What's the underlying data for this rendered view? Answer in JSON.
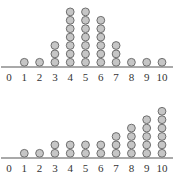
{
  "colors": {
    "dot_fill": "#c6c6c6",
    "dot_stroke": "#6e6e6e",
    "axis": "#555555",
    "label": "#333333"
  },
  "chart_data": [
    {
      "type": "dot_plot",
      "title": "",
      "xlabel": "",
      "ylabel": "",
      "categories": [
        "0",
        "1",
        "2",
        "3",
        "4",
        "5",
        "6",
        "7",
        "8",
        "9",
        "10"
      ],
      "values": [
        0,
        1,
        1,
        3,
        7,
        7,
        6,
        3,
        1,
        1,
        1
      ],
      "xlim": [
        0,
        10
      ],
      "grid": false,
      "legend": null
    },
    {
      "type": "dot_plot",
      "title": "",
      "xlabel": "",
      "ylabel": "",
      "categories": [
        "0",
        "1",
        "2",
        "3",
        "4",
        "5",
        "6",
        "7",
        "8",
        "9",
        "10"
      ],
      "values": [
        0,
        1,
        1,
        2,
        2,
        2,
        2,
        3,
        4,
        5,
        6
      ],
      "xlim": [
        0,
        10
      ],
      "grid": false,
      "legend": null
    }
  ]
}
